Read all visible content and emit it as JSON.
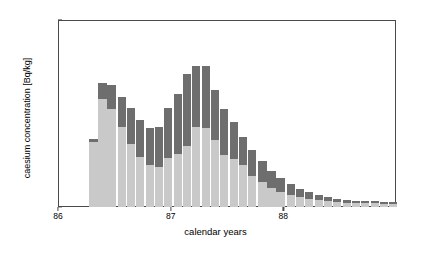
{
  "chart_data": {
    "type": "bar",
    "stacked": true,
    "title": "",
    "xlabel": "calendar years",
    "ylabel": "caesium concentration [Bq/kg]",
    "xlim": [
      86.0,
      89.0
    ],
    "ylim": [
      0,
      50
    ],
    "xticks": [
      86,
      87,
      88
    ],
    "xticklabels": [
      "86",
      "87",
      "88"
    ],
    "yticks": [
      0,
      10,
      20,
      30,
      40,
      50
    ],
    "yticklabels": [
      "0",
      "10",
      "20",
      "30",
      "40",
      "50"
    ],
    "grid": false,
    "legend": false,
    "bar_width_years": 0.083,
    "colors": {
      "lower_segment": "#c9c9c9",
      "upper_segment": "#6e6e6e",
      "axis": "#4a4a4a",
      "background": "#ffffff"
    },
    "series": [
      {
        "name": "lower segment",
        "color": "#c9c9c9",
        "values": [
          17.5,
          28.8,
          26.3,
          21.3,
          16.9,
          13.4,
          11.2,
          10.7,
          13.1,
          14.2,
          16.4,
          21.5,
          21.2,
          17.8,
          13.9,
          12.9,
          11.3,
          8.4,
          6.6,
          5.2,
          4.1,
          3.2,
          2.6,
          2.1,
          1.8,
          1.5,
          1.3,
          1.2,
          1.1,
          1.0,
          1.0,
          0.9,
          0.9
        ]
      },
      {
        "name": "upper segment",
        "color": "#6e6e6e",
        "values": [
          0.6,
          4.4,
          6.3,
          8.1,
          9.5,
          9.8,
          9.9,
          10.6,
          13.3,
          16.1,
          19.1,
          16.2,
          16.5,
          13.6,
          12.3,
          9.8,
          7.5,
          6.8,
          5.6,
          4.5,
          3.6,
          2.9,
          2.3,
          1.9,
          1.4,
          1.1,
          0.9,
          0.8,
          0.6,
          0.6,
          0.5,
          0.5,
          0.4
        ]
      }
    ],
    "x": [
      86.32,
      86.4,
      86.48,
      86.57,
      86.65,
      86.73,
      86.82,
      86.9,
      86.98,
      87.07,
      87.15,
      87.23,
      87.32,
      87.4,
      87.48,
      87.57,
      87.65,
      87.73,
      87.82,
      87.9,
      87.98,
      88.07,
      88.15,
      88.23,
      88.32,
      88.4,
      88.48,
      88.57,
      88.65,
      88.73,
      88.82,
      88.9,
      88.98
    ],
    "totals": [
      18.1,
      33.2,
      32.6,
      29.4,
      26.4,
      23.2,
      21.1,
      21.3,
      26.4,
      30.3,
      35.5,
      37.7,
      37.7,
      31.4,
      26.2,
      22.7,
      18.8,
      15.2,
      12.2,
      9.7,
      7.7,
      6.1,
      4.9,
      4.0,
      3.2,
      2.6,
      2.2,
      2.0,
      1.7,
      1.6,
      1.5,
      1.4,
      1.3
    ]
  }
}
